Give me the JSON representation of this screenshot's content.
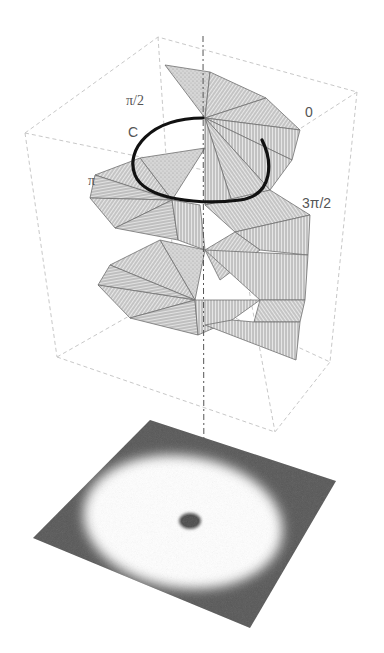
{
  "figure": {
    "labels": {
      "pi_half": "π/2",
      "loop": "C",
      "pi": "π",
      "zero": "0",
      "three_pi_half": "3π/2"
    },
    "colors": {
      "surface_fill": "#e4e4e4",
      "surface_hatch": "#8a8a8a",
      "surface_edge": "#6f6f6f",
      "loop_curve": "#111111",
      "box_frame": "#c8c8c8",
      "axis": "#555555",
      "plane_dark": "#555555",
      "ring_bright": "#ffffff",
      "core_dark": "#4a4a4a",
      "label_text": "#555555"
    },
    "box": {
      "top_face": [
        [
          25,
          133
        ],
        [
          158,
          37
        ],
        [
          357,
          92
        ],
        [
          228,
          175
        ]
      ],
      "bottom_face": [
        [
          57,
          357
        ],
        [
          175,
          290
        ],
        [
          330,
          362
        ],
        [
          275,
          432
        ]
      ]
    },
    "axis": {
      "x_top": 203,
      "y_top": 36,
      "x_bottom": 204,
      "y_bottom": 520
    },
    "plane": {
      "corners": [
        [
          150,
          420
        ],
        [
          336,
          481
        ],
        [
          250,
          628
        ],
        [
          33,
          538
        ]
      ],
      "ring_center": [
        190,
        522
      ],
      "core_radius": [
        11,
        8
      ]
    }
  }
}
